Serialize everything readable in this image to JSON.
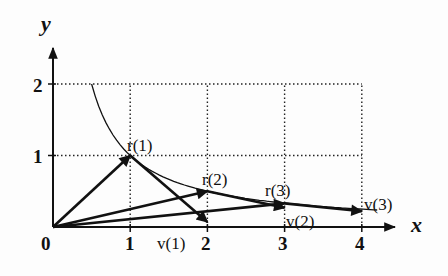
{
  "axes": {
    "x_label": "x",
    "y_label": "y",
    "x_ticks": [
      "0",
      "1",
      "2",
      "3",
      "4"
    ],
    "y_ticks": [
      "1",
      "2"
    ]
  },
  "curve": {
    "equation": "y = 1/x",
    "x_range": [
      0.5,
      4.2
    ]
  },
  "vectors": [
    {
      "name": "r(1)",
      "label": "r(1)",
      "from": [
        0,
        0
      ],
      "to": [
        1,
        1
      ]
    },
    {
      "name": "v(1)",
      "label": "v(1)",
      "from": [
        1,
        1
      ],
      "to": [
        2,
        0.07
      ]
    },
    {
      "name": "r(2)",
      "label": "r(2)",
      "from": [
        0,
        0
      ],
      "to": [
        2,
        0.5
      ]
    },
    {
      "name": "v(2)",
      "label": "v(2)",
      "from": [
        2,
        0.5
      ],
      "to": [
        3,
        0.27
      ]
    },
    {
      "name": "r(3)",
      "label": "r(3)",
      "from": [
        0,
        0
      ],
      "to": [
        3,
        0.33
      ]
    },
    {
      "name": "v(3)",
      "label": "v(3)",
      "from": [
        3,
        0.33
      ],
      "to": [
        4,
        0.22
      ]
    }
  ],
  "grid": {
    "x_lines": [
      1,
      2,
      3,
      4
    ],
    "y_lines": [
      1,
      2
    ]
  },
  "colors": {
    "ink": "#111111",
    "background": "#fdfdfd"
  }
}
